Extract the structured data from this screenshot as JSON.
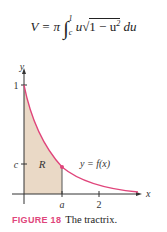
{
  "formula": {
    "lhs": "V = π",
    "integral_upper": "1",
    "integral_lower": "c",
    "integrand_pre": "u",
    "sqrt_content": "1 − u",
    "exponent": "2",
    "differential": "du"
  },
  "figure": {
    "axes": {
      "x_label": "x",
      "y_label": "y"
    },
    "y_ticks": [
      {
        "label": "1"
      },
      {
        "label": "c"
      }
    ],
    "x_ticks": [
      {
        "label": "a"
      },
      {
        "label": "2"
      }
    ],
    "region_label": "R",
    "curve_label": "y = f(x)",
    "colors": {
      "curve": "#e0457b",
      "region": "#ead9c6",
      "axis": "#333333",
      "caption_label": "#e0457b"
    }
  },
  "caption": {
    "label": "FIGURE 18",
    "text": "The tractrix."
  }
}
